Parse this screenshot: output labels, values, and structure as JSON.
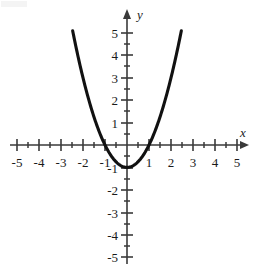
{
  "figure": {
    "background_color": "#ffffff",
    "curve_color": "#111111",
    "axis_color": "#3a3a3a",
    "label_color": "#1a1a1a",
    "x_axis_name": "x",
    "y_axis_name": "y"
  },
  "chart_data": {
    "type": "line",
    "title": "",
    "subtitle": "",
    "xlabel": "x",
    "ylabel": "y",
    "equation": "y = x^2 - 1",
    "grid": false,
    "legend": null,
    "xlim": [
      -5.6,
      5.6
    ],
    "ylim": [
      -5.6,
      5.9
    ],
    "x_major_ticks": [
      -5,
      -4,
      -3,
      -2,
      -1,
      1,
      2,
      3,
      4,
      5
    ],
    "x_minor_ticks": [
      -4.5,
      -3.5,
      -2.5,
      -1.5,
      -0.5,
      0.5,
      1.5,
      2.5,
      3.5,
      4.5
    ],
    "y_major_ticks": [
      -5,
      -4,
      -3,
      -2,
      -1,
      1,
      2,
      3,
      4,
      5
    ],
    "y_minor_ticks": [
      -4.5,
      -3.5,
      -2.5,
      -1.5,
      -0.5,
      0.5,
      1.5,
      2.5,
      3.5,
      4.5
    ],
    "x_tick_labels": [
      "-5",
      "-4",
      "-3",
      "-2",
      "-1",
      "1",
      "2",
      "3",
      "4",
      "5"
    ],
    "y_tick_labels": [
      "-5",
      "-4",
      "-3",
      "-2",
      "-1",
      "1",
      "2",
      "3",
      "4",
      "5"
    ],
    "vertex": [
      0,
      -1
    ],
    "x_intercepts": [
      -1,
      1
    ],
    "y_intercept": -1,
    "domain_drawn": [
      -2.47,
      2.47
    ],
    "series": [
      {
        "name": "y = x^2 - 1",
        "x": [
          -2.47,
          -2.3,
          -2.1,
          -1.9,
          -1.7,
          -1.5,
          -1.3,
          -1.1,
          -0.9,
          -0.7,
          -0.5,
          -0.3,
          -0.1,
          0,
          0.1,
          0.3,
          0.5,
          0.7,
          0.9,
          1.1,
          1.3,
          1.5,
          1.7,
          1.9,
          2.1,
          2.3,
          2.47
        ],
        "y": [
          5.1,
          4.29,
          3.41,
          2.61,
          1.89,
          1.25,
          0.69,
          0.21,
          -0.19,
          -0.51,
          -0.75,
          -0.91,
          -0.99,
          -1,
          -0.99,
          -0.91,
          -0.75,
          -0.51,
          -0.19,
          0.21,
          0.69,
          1.25,
          1.89,
          2.61,
          3.41,
          4.29,
          5.1
        ]
      }
    ]
  }
}
